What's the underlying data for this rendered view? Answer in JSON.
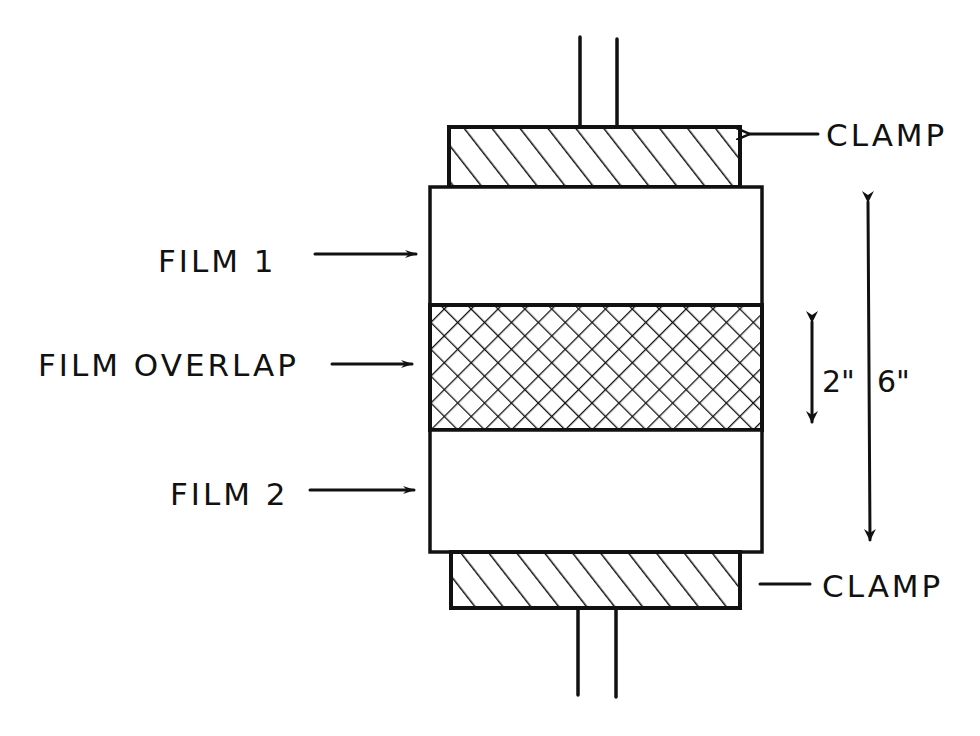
{
  "diagram": {
    "labels": {
      "clamp_top": "CLAMP",
      "clamp_bottom": "CLAMP",
      "film_1": "FILM 1",
      "film_overlap": "FILM OVERLAP",
      "film_2": "FILM 2"
    },
    "dimensions": {
      "overlap_length": "2\"",
      "total_length": "6\""
    },
    "patterns": {
      "clamp": "diagonal-hatch",
      "overlap": "cross-hatch"
    },
    "colors": {
      "ink": "#111111",
      "background": "#ffffff"
    }
  }
}
